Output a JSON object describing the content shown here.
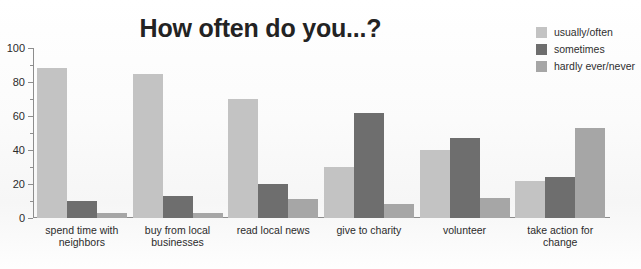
{
  "chart_data": {
    "type": "bar",
    "title": "How often do you...?",
    "xlabel": "",
    "ylabel": "",
    "ylim": [
      0,
      100
    ],
    "yticks": [
      0,
      20,
      40,
      60,
      80,
      100
    ],
    "yminorticks": [
      10,
      30,
      50,
      70,
      90
    ],
    "grid": false,
    "legend_position": "top-right",
    "categories": [
      "spend time with neighbors",
      "buy from local businesses",
      "read local news",
      "give to charity",
      "volunteer",
      "take action for change"
    ],
    "category_lines": [
      [
        "spend time with",
        "neighbors"
      ],
      [
        "buy from local",
        "businesses"
      ],
      [
        "read local news",
        ""
      ],
      [
        "give to charity",
        ""
      ],
      [
        "volunteer",
        ""
      ],
      [
        "take action for",
        "change"
      ]
    ],
    "series": [
      {
        "name": "usually/often",
        "color": "#c3c3c3",
        "values": [
          88,
          85,
          70,
          30,
          40,
          22
        ]
      },
      {
        "name": "sometimes",
        "color": "#6e6e6e",
        "values": [
          10,
          13,
          20,
          62,
          47,
          24
        ]
      },
      {
        "name": "hardly ever/never",
        "color": "#a6a6a6",
        "values": [
          3,
          3,
          11,
          8,
          12,
          53
        ]
      }
    ]
  },
  "axis": {
    "tick_labels": [
      "100",
      "80",
      "60",
      "40",
      "20",
      "0"
    ]
  }
}
